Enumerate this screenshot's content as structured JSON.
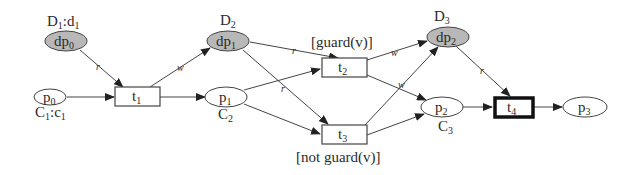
{
  "diagram": {
    "type": "petri-net",
    "places": [
      {
        "id": "dp0",
        "label": "dp",
        "sub": "0",
        "kind": "data",
        "annotation": "D",
        "annotation_sub": "1",
        "annotation_suffix": ":d",
        "annotation_suffix_sub": "1"
      },
      {
        "id": "p0",
        "label": "p",
        "sub": "0",
        "kind": "control",
        "annotation": "C",
        "annotation_sub": "1",
        "annotation_suffix": ":c",
        "annotation_suffix_sub": "1"
      },
      {
        "id": "dp1",
        "label": "dp",
        "sub": "1",
        "kind": "data",
        "annotation": "D",
        "annotation_sub": "2"
      },
      {
        "id": "p1",
        "label": "p",
        "sub": "1",
        "kind": "control",
        "annotation": "C",
        "annotation_sub": "2"
      },
      {
        "id": "dp2",
        "label": "dp",
        "sub": "2",
        "kind": "data",
        "annotation": "D",
        "annotation_sub": "3"
      },
      {
        "id": "p2",
        "label": "p",
        "sub": "2",
        "kind": "control",
        "annotation": "C",
        "annotation_sub": "3"
      },
      {
        "id": "p3",
        "label": "p",
        "sub": "3",
        "kind": "control"
      }
    ],
    "transitions": [
      {
        "id": "t1",
        "label": "t",
        "sub": "1"
      },
      {
        "id": "t2",
        "label": "t",
        "sub": "2",
        "guard": "[guard(v)]"
      },
      {
        "id": "t3",
        "label": "t",
        "sub": "3",
        "guard": "[not guard(v)]"
      },
      {
        "id": "t4",
        "label": "t",
        "sub": "4",
        "highlighted": true
      }
    ],
    "arcs": [
      {
        "from": "dp0",
        "to": "t1",
        "label": "r"
      },
      {
        "from": "p0",
        "to": "t1"
      },
      {
        "from": "t1",
        "to": "dp1",
        "label": "w"
      },
      {
        "from": "t1",
        "to": "p1"
      },
      {
        "from": "dp1",
        "to": "t2",
        "label": "r"
      },
      {
        "from": "dp1",
        "to": "t3",
        "label": "r"
      },
      {
        "from": "p1",
        "to": "t2"
      },
      {
        "from": "p1",
        "to": "t3"
      },
      {
        "from": "t2",
        "to": "dp2",
        "label": "w"
      },
      {
        "from": "t2",
        "to": "p2"
      },
      {
        "from": "t3",
        "to": "dp2",
        "label": "w"
      },
      {
        "from": "t3",
        "to": "p2"
      },
      {
        "from": "dp2",
        "to": "t4",
        "label": "r"
      },
      {
        "from": "p2",
        "to": "t4"
      },
      {
        "from": "t4",
        "to": "p3"
      }
    ],
    "arc_labels": {
      "read": "r",
      "write": "w"
    },
    "colors": {
      "data_place_fill": "#b8b8b8",
      "stroke": "#444444",
      "background": "#ffffff"
    }
  }
}
